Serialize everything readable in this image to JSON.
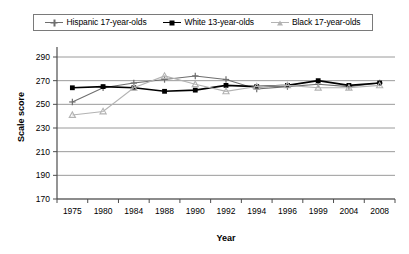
{
  "chart_data": {
    "type": "line",
    "title": "",
    "xlabel": "Year",
    "ylabel": "Scale score",
    "categories": [
      "1975",
      "1980",
      "1984",
      "1988",
      "1990",
      "1992",
      "1994",
      "1996",
      "1999",
      "2004",
      "2008"
    ],
    "ylim": [
      170,
      290
    ],
    "yticks": [
      170,
      190,
      210,
      230,
      250,
      270,
      290
    ],
    "grid": "horizontal",
    "legend_position": "top",
    "series": [
      {
        "name": "Hispanic 17-year-olds",
        "marker": "plus",
        "color": "#6e6e6e",
        "values": [
          252,
          264,
          268,
          271,
          274,
          271,
          263,
          265,
          267,
          265,
          268
        ]
      },
      {
        "name": "White 13-year-olds",
        "marker": "square",
        "color": "#000000",
        "values": [
          264,
          265,
          264,
          261,
          262,
          266,
          265,
          266,
          270,
          266,
          268
        ]
      },
      {
        "name": "Black 17-year-olds",
        "marker": "triangle",
        "color": "#b3b3b3",
        "values": [
          241,
          244,
          264,
          274,
          267,
          261,
          265,
          266,
          264,
          264,
          266
        ]
      }
    ]
  },
  "legend": {
    "items": [
      {
        "label": "Hispanic 17-year-olds"
      },
      {
        "label": "White 13-year-olds"
      },
      {
        "label": "Black 17-year-olds"
      }
    ]
  },
  "axes": {
    "x_title": "Year",
    "y_title": "Scale score"
  },
  "colors": {
    "hispanic": "#6e6e6e",
    "white": "#000000",
    "black": "#b3b3b3",
    "grid": "#808080",
    "axis": "#4d4d4d"
  }
}
